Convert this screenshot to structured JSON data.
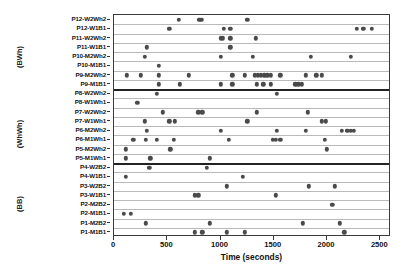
{
  "chart_data": {
    "type": "scatter",
    "title": "",
    "xlabel": "Time (seconds)",
    "ylabel": "",
    "xlim": [
      0,
      2600
    ],
    "xticks": [
      0,
      500,
      1000,
      1500,
      2000,
      2500
    ],
    "xticklabels": [
      "0",
      "500",
      "1000",
      "1500",
      "2000",
      "2500"
    ],
    "grid": true,
    "legend_position": "none",
    "marker": "filled-circle",
    "marker_color": "#4a4a4a",
    "groups": [
      {
        "name": "(BWh)",
        "rows": [
          {
            "label": "P12-W2Wh2",
            "values": [
              610,
              800,
              820,
              1250
            ]
          },
          {
            "label": "P12-W1B1",
            "values": [
              520,
              1030,
              1090,
              2280,
              2340,
              2420
            ]
          },
          {
            "label": "P11-W2Wh2",
            "values": [
              1000,
              1020,
              1090,
              1330
            ]
          },
          {
            "label": "P11-W1B1",
            "values": [
              310,
              1090
            ]
          },
          {
            "label": "P10-M2Wh2",
            "values": [
              290,
              1000,
              1300,
              1850,
              2220
            ]
          },
          {
            "label": "P10-M1B1",
            "values": [
              420
            ]
          },
          {
            "label": "P9-M2Wh2",
            "values": [
              120,
              250,
              420,
              700,
              1110,
              1230,
              1320,
              1350,
              1380,
              1410,
              1440,
              1470,
              1560,
              1800,
              1900,
              1950
            ]
          },
          {
            "label": "P9-M1B1",
            "values": [
              420,
              620,
              1000,
              1110,
              1340,
              1400,
              1470,
              1700,
              1730,
              1760
            ]
          }
        ]
      },
      {
        "name": "(WhWh)",
        "rows": [
          {
            "label": "P8-W2Wh2",
            "values": [
              400,
              1530
            ]
          },
          {
            "label": "P8-W1Wh1",
            "values": [
              220
            ]
          },
          {
            "label": "P7-W2Wh2",
            "values": [
              460,
              790,
              830,
              1340,
              1820
            ]
          },
          {
            "label": "P7-W1Wh1",
            "values": [
              290,
              520,
              570,
              1250,
              1950,
              1990
            ]
          },
          {
            "label": "P6-M2Wh2",
            "values": [
              310,
              1000,
              1530,
              1800,
              2140,
              2190,
              2220,
              2250
            ]
          },
          {
            "label": "P6-M1Wh1",
            "values": [
              180,
              300,
              400,
              560,
              1080,
              1490,
              1520,
              1560,
              1980
            ]
          },
          {
            "label": "P5-M2Wh2",
            "values": [
              110,
              530,
              2000
            ]
          },
          {
            "label": "P5-M1Wh1",
            "values": [
              110,
              340,
              900
            ]
          }
        ]
      },
      {
        "name": "(BB)",
        "rows": [
          {
            "label": "P4-W2B2",
            "values": [
              330,
              870
            ]
          },
          {
            "label": "P4-W1B1",
            "values": [
              110,
              1210
            ]
          },
          {
            "label": "P3-W2B2",
            "values": [
              1060,
              1830,
              2070
            ]
          },
          {
            "label": "P3-W1B1",
            "values": [
              760,
              790,
              1520
            ]
          },
          {
            "label": "P2-M2B2",
            "values": [
              2050
            ]
          },
          {
            "label": "P2-M1B1",
            "values": [
              90,
              160
            ]
          },
          {
            "label": "P1-M2B2",
            "values": [
              300,
              900,
              1770,
              2120
            ]
          },
          {
            "label": "P1-M1B1",
            "values": [
              760,
              830,
              1060,
              1230,
              2160
            ]
          }
        ]
      }
    ]
  }
}
